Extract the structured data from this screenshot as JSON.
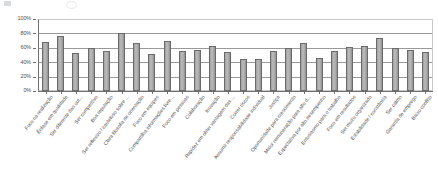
{
  "chart_data": {
    "type": "bar",
    "title": "",
    "subtitle": "",
    "xlabel": "",
    "ylabel": "",
    "ylim": [
      0,
      100
    ],
    "y_ticks": [
      "0%",
      "20%",
      "40%",
      "60%",
      "80%",
      "100%"
    ],
    "y_tick_values": [
      0,
      20,
      40,
      60,
      80,
      100
    ],
    "grid": true,
    "legend": false,
    "legend_position": "none",
    "orientation": "vertical",
    "bar_color": "#ababab",
    "bar_edge_color": "#6b6b6b",
    "axis_color": "#6f6f6f",
    "grid_color": "#9a9a9a",
    "categories": [
      "Foco na realização",
      "Ênfase em qualidade",
      "Ser diferente das out...",
      "Ser competitivo",
      "Boa reputação",
      "Ser reflexivo / cauteloso sobre ...",
      "Clara filosofia de orientação",
      "Foco em equipes",
      "Compartilha informações livre...",
      "Foco em pessoas",
      "Colaboração",
      "Inovação",
      "Rapidez em obter vantagem das ...",
      "Correr riscos",
      "Assumir responsabilidade individual",
      "Justiça",
      "Oportunidade para crescimento",
      "Maior remuneração para alto d...",
      "Expectativa por alto desempenho",
      "Entusiasmo para o trabalho",
      "Foco em resultados",
      "Ser muito organizado",
      "Estabilidade / constância",
      "Ser calmo",
      "Garantia de emprego",
      "Baixo conflito"
    ],
    "values": [
      68,
      76,
      53,
      60,
      56,
      81,
      66,
      51,
      70,
      55,
      57,
      62,
      54,
      44,
      44,
      56,
      60,
      67,
      46,
      55,
      61,
      62,
      74,
      60,
      57,
      54
    ]
  }
}
